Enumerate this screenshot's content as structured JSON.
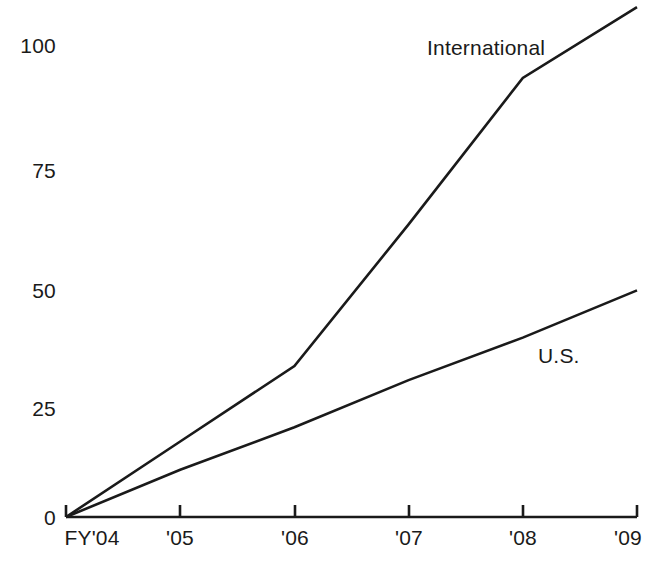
{
  "chart_data": {
    "type": "line",
    "title": "",
    "subtitle": "",
    "xlabel": "",
    "ylabel": "",
    "grid": false,
    "legend_position": "inline-end-of-series",
    "categories": [
      "FY'04",
      "'05",
      "'06",
      "'07",
      "'08",
      "'09"
    ],
    "x": [
      2004,
      2005,
      2006,
      2007,
      2008,
      2009
    ],
    "xlim": [
      2004,
      2009
    ],
    "ylim": [
      0,
      108
    ],
    "yticks": [
      0,
      25,
      50,
      75,
      100
    ],
    "ytick_labels": [
      "0",
      "25",
      "50",
      "75",
      "100"
    ],
    "xtick_labels": [
      "FY'04",
      "'05",
      "'06",
      "'07",
      "'08",
      "'09"
    ],
    "series": [
      {
        "name": "International",
        "values": [
          0,
          16,
          32,
          62,
          93,
          108
        ],
        "color": "#1a1a1a",
        "label": "International"
      },
      {
        "name": "U.S.",
        "values": [
          0,
          10,
          19,
          29,
          38,
          48
        ],
        "color": "#1a1a1a",
        "label": "U.S."
      }
    ],
    "annotations": [
      {
        "text": "International",
        "x": 2007.2,
        "y": 100
      },
      {
        "text": "U.S.",
        "x": 2008.2,
        "y": 35
      }
    ]
  },
  "axes": {
    "y_labels": [
      {
        "value": "100",
        "px": 45
      },
      {
        "value": "75",
        "px": 170
      },
      {
        "value": "50",
        "px": 290
      },
      {
        "value": "25",
        "px": 408
      },
      {
        "value": "0",
        "px": 517
      }
    ],
    "x_labels": [
      {
        "value": "FY'04",
        "px": 92
      },
      {
        "value": "'05",
        "px": 180
      },
      {
        "value": "'06",
        "px": 295
      },
      {
        "value": "'07",
        "px": 409
      },
      {
        "value": "'08",
        "px": 523
      },
      {
        "value": "'09",
        "px": 628
      }
    ]
  },
  "series_labels": {
    "international": "International",
    "us": "U.S."
  },
  "colors": {
    "line": "#1a1a1a",
    "axis": "#1a1a1a",
    "background": "#ffffff",
    "text": "#1a1a1a"
  }
}
